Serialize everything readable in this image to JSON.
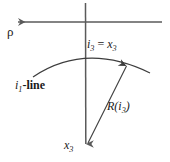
{
  "figure": {
    "type": "geometric-diagram",
    "background_color": "#ffffff",
    "stroke_color": "#5a5a5a",
    "arc_color": "#3d3d3d",
    "text_color": "#1a1a1a",
    "labels": {
      "rho": "ρ",
      "i3_equals_x3": {
        "left_var": "i",
        "left_sub": "3",
        "operator": "=",
        "right_var": "x",
        "right_sub": "3"
      },
      "i1_line": {
        "var": "i",
        "sub": "1",
        "suffix": "-line"
      },
      "radius": {
        "fn": "R",
        "open": "(",
        "var": "i",
        "sub": "3",
        "close": ")"
      },
      "x3_axis": {
        "var": "x",
        "sub": "3"
      }
    },
    "geometry": {
      "horizontal_axis": {
        "x1": 162,
        "y1": 22,
        "x2": 16,
        "y2": 22,
        "arrow": "left"
      },
      "vertical_axis": {
        "x1": 85,
        "y1": 3,
        "x2": 86,
        "y2": 151,
        "arrow": "down"
      },
      "arc": {
        "start_x": 33,
        "start_y": 77,
        "peak_x": 85,
        "peak_y": 53,
        "end_x": 150,
        "end_y": 73
      },
      "radius_arrow": {
        "x1": 88,
        "y1": 143,
        "x2": 128,
        "y2": 62,
        "arrow": "up-right"
      }
    }
  }
}
